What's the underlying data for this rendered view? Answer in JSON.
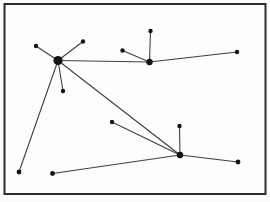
{
  "figure": {
    "type": "network-graph-diagram",
    "title": "",
    "background_color": "#fcfcfa",
    "frame": {
      "x": 4.5,
      "y": 4,
      "width": 261,
      "height": 190,
      "stroke_color": "#2b2b2b",
      "stroke_width": 2,
      "fill": "#fdfdfc"
    },
    "style": {
      "node_color": "#141414",
      "edge_color": "#3f3f3f",
      "edge_width": 1.1
    },
    "nodes": [
      {
        "id": "hub-a",
        "role": "hub-large",
        "x": 58,
        "y": 60.5,
        "r": 4.6
      },
      {
        "id": "hub-b",
        "role": "hub-medium",
        "x": 149.5,
        "y": 62,
        "r": 3.2
      },
      {
        "id": "hub-c",
        "role": "hub-medium",
        "x": 180,
        "y": 155,
        "r": 3.2
      },
      {
        "id": "n1",
        "role": "leaf",
        "x": 36,
        "y": 46,
        "r": 2.2
      },
      {
        "id": "n2",
        "role": "leaf",
        "x": 83,
        "y": 41.5,
        "r": 2.2
      },
      {
        "id": "n3",
        "role": "leaf",
        "x": 63,
        "y": 91,
        "r": 2.2
      },
      {
        "id": "n4",
        "role": "leaf",
        "x": 19,
        "y": 172,
        "r": 2.4
      },
      {
        "id": "n5",
        "role": "leaf",
        "x": 122.5,
        "y": 50.5,
        "r": 2.2
      },
      {
        "id": "n6",
        "role": "leaf",
        "x": 150.5,
        "y": 31,
        "r": 2.2
      },
      {
        "id": "n7",
        "role": "leaf",
        "x": 237,
        "y": 52,
        "r": 2.2
      },
      {
        "id": "n8",
        "role": "leaf",
        "x": 112,
        "y": 122,
        "r": 2.2
      },
      {
        "id": "n9",
        "role": "leaf",
        "x": 179.5,
        "y": 126,
        "r": 2.2
      },
      {
        "id": "n10",
        "role": "leaf",
        "x": 238,
        "y": 162,
        "r": 2.4
      },
      {
        "id": "n11",
        "role": "leaf",
        "x": 52.5,
        "y": 173.5,
        "r": 2.4
      }
    ],
    "edges": [
      {
        "from": "hub-a",
        "to": "n1"
      },
      {
        "from": "hub-a",
        "to": "n2"
      },
      {
        "from": "hub-a",
        "to": "n3"
      },
      {
        "from": "hub-a",
        "to": "n4"
      },
      {
        "from": "hub-a",
        "to": "hub-b"
      },
      {
        "from": "hub-a",
        "to": "hub-c"
      },
      {
        "from": "hub-b",
        "to": "n5"
      },
      {
        "from": "hub-b",
        "to": "n6"
      },
      {
        "from": "hub-b",
        "to": "n7"
      },
      {
        "from": "hub-c",
        "to": "n8"
      },
      {
        "from": "hub-c",
        "to": "n9"
      },
      {
        "from": "hub-c",
        "to": "n10"
      },
      {
        "from": "hub-c",
        "to": "n11"
      }
    ]
  }
}
